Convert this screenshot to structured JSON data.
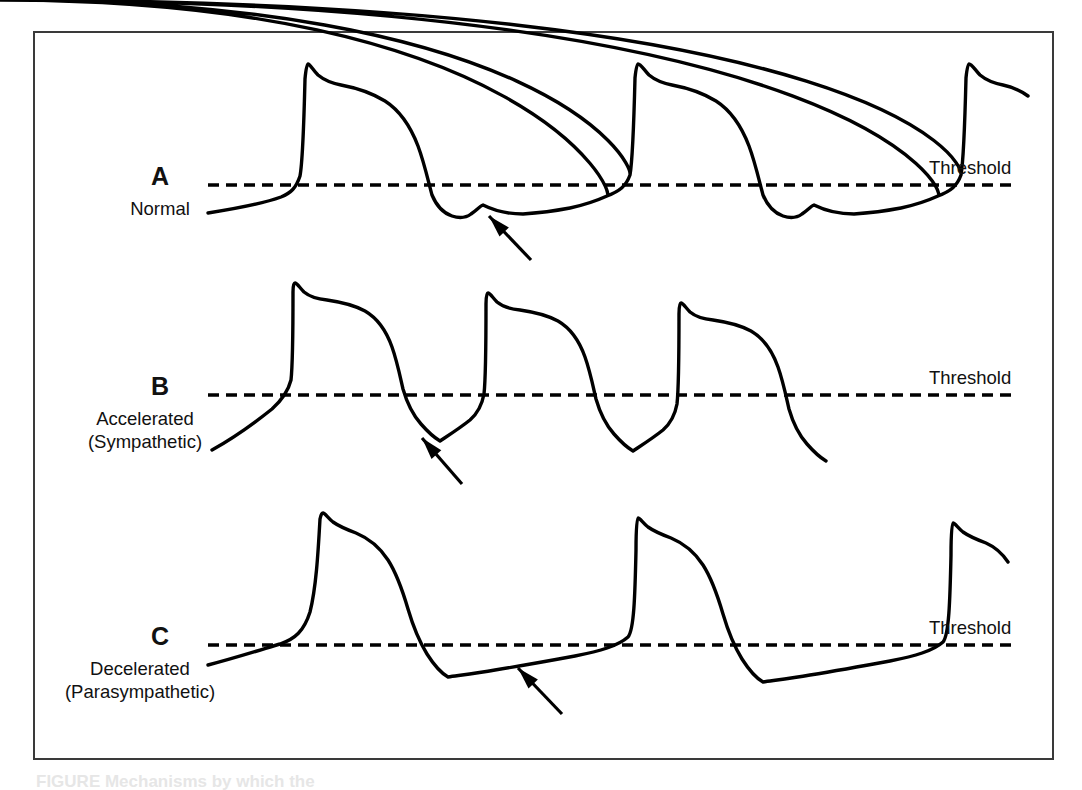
{
  "figure": {
    "background_color": "#ffffff",
    "frame_color": "#3a3a3a",
    "trace_color": "#000000",
    "bottom_caption": "FIGURE    Mechanisms by which the"
  },
  "panels": [
    {
      "letter": "A",
      "caption": "Normal",
      "threshold_label": "Threshold",
      "threshold_y": 185,
      "spike_count": 3,
      "letter_pos": {
        "x": 80,
        "y": 162
      },
      "caption_pos": {
        "x": 45,
        "y": 197
      },
      "threshold_label_pos": {
        "x": 929,
        "y": 157
      },
      "threshold_x1": 208,
      "threshold_x2": 1014,
      "arrow": {
        "tail_x": 531,
        "tail_y": 260,
        "head_x": 489,
        "head_y": 216
      },
      "trace": "M 208,213 C 240,208 262,204 281,197 C 291,193 296,188 300,176 C 303,160 304,120 305,79 C 306,68 307,64 308,64 C 310,64 313,70 318,75 C 324,80 331,83 341,85 C 357,88 372,93 385,101 C 399,110 410,125 418,146 C 424,162 428,180 432,195 C 437,207 443,213 452,216 C 461,219 467,217 471,214 C 477,210 480,206 483,205 C 495,211 508,214 523,214 C 540,213 555,211 570,208 C 584,205 596,201 607,196 C 617,191 523,0 0,0 M 607,196 C 620,191 626,186 630,175 C 633,158 535,0 0,0 M 630,175 C 633,158 634,118 635,78 C 636,68 637,64 638,64 C 641,64 644,70 649,75 C 655,80 662,83 672,85 C 688,88 703,93 716,101 C 730,110 741,125 749,146 C 755,162 759,180 763,195 C 768,207 774,213 783,216 C 792,219 798,217 802,214 C 808,210 811,206 814,205 C 826,211 839,214 854,214 C 871,213 886,211 901,208 C 915,205 927,201 938,196 C 948,191 854,0 0,0 M 938,196 C 951,191 957,186 961,175 C 964,158 866,0 0,0 M 961,175 C 964,158 965,118 966,78 C 967,68 968,64 969,64 C 972,64 975,70 980,75 C 986,80 993,83 1003,85 C 1013,87 1021,91 1028,96"
    },
    {
      "letter": "B",
      "caption_line1": "Accelerated",
      "caption_line2": "(Sympathetic)",
      "threshold_label": "Threshold",
      "threshold_y": 395,
      "spike_count": 4,
      "letter_pos": {
        "x": 80,
        "y": 372
      },
      "caption_pos": {
        "x": 30,
        "y": 407
      },
      "threshold_label_pos": {
        "x": 929,
        "y": 367
      },
      "threshold_x1": 208,
      "threshold_x2": 1014,
      "arrow": {
        "tail_x": 462,
        "tail_y": 484,
        "head_x": 422,
        "head_y": 438
      },
      "trace": "M 212,450 C 230,440 252,425 272,409 C 282,400 288,392 291,380 C 293,362 293,322 293,292 C 293,285 294,283 295,283 C 297,283 300,288 304,292 C 310,297 317,299 327,300 C 341,302 354,305 365,311 C 377,318 386,330 392,347 C 397,361 400,376 403,389 C 407,403 413,415 421,424 C 428,432 435,438 440,441 C 449,435 460,428 470,420 C 478,413 482,405 484,394 C 486,376 486,334 486,304 C 486,296 487,293 488,293 C 490,293 493,298 497,302 C 503,307 510,309 520,310 C 534,312 547,315 558,321 C 570,328 579,340 585,357 C 590,371 593,386 596,399 C 600,413 606,425 614,434 C 621,442 628,448 633,451 C 642,445 653,438 663,430 C 671,423 675,415 677,404 C 679,386 679,344 679,314 C 679,306 680,303 681,303 C 683,303 686,308 690,312 C 696,317 703,319 713,320 C 727,322 740,325 751,331 C 763,338 772,350 778,367 C 783,381 786,396 789,409 C 793,423 799,435 807,444 C 814,452 821,458 826,461"
    },
    {
      "letter": "C",
      "caption_line1": "Decelerated",
      "caption_line2": "(Parasympathetic)",
      "threshold_label": "Threshold",
      "threshold_y": 645,
      "spike_count": 3,
      "letter_pos": {
        "x": 80,
        "y": 622
      },
      "caption_pos": {
        "x": 25,
        "y": 657
      },
      "threshold_label_pos": {
        "x": 929,
        "y": 617
      },
      "threshold_x1": 208,
      "threshold_x2": 1014,
      "arrow": {
        "tail_x": 562,
        "tail_y": 714,
        "head_x": 518,
        "head_y": 668
      },
      "trace": "M 208,665 C 235,658 260,650 280,644 C 295,639 304,631 310,612 C 316,588 318,555 320,519 C 321,514 322,513 323,513 C 325,513 328,518 333,522 C 340,527 348,530 356,533 C 368,538 379,546 388,560 C 397,574 403,592 408,609 C 413,626 419,641 427,654 C 434,665 441,673 448,677 C 462,675 478,673 495,670 C 520,666 548,661 575,656 C 600,651 618,646 628,637 C 634,630 635,596 636,550 C 636,527 637,518 638,518 C 640,518 643,523 648,527 C 655,532 663,535 671,538 C 683,543 694,551 703,565 C 712,579 718,597 723,614 C 728,631 734,646 742,659 C 749,670 756,678 763,682 C 777,680 793,678 810,675 C 835,671 863,666 890,661 C 915,656 933,651 943,642 C 949,635 950,601 951,555 C 951,532 952,523 953,523 C 955,523 958,528 963,532 C 970,537 978,540 986,543 C 995,547 1002,553 1008,562"
    }
  ]
}
